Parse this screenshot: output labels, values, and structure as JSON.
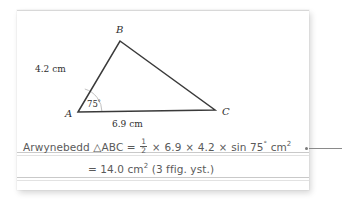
{
  "page": {
    "language": "Welsh",
    "background_color": "#ffffff",
    "card_color": "#ffffff",
    "ink_color": "#5a5a5a",
    "line_color": "#c9c9c9"
  },
  "diagram": {
    "name": "triangle-abc",
    "vertices": [
      {
        "label": "A",
        "x": 61,
        "y": 102
      },
      {
        "label": "B",
        "x": 103,
        "y": 31
      },
      {
        "label": "C",
        "x": 198,
        "y": 100
      }
    ],
    "side_labels": [
      {
        "id": "ab",
        "text": "4.2 cm",
        "x": 20,
        "y": 58
      },
      {
        "id": "ac",
        "text": "6.9 cm",
        "x": 96,
        "y": 112
      }
    ],
    "angle_label": {
      "text": "75",
      "degree": "°",
      "x": 72,
      "y": 92
    },
    "stroke_color": "#3a3a3a"
  },
  "working": {
    "line1": {
      "lead": "Arwynebedd",
      "triangle_symbol": "△",
      "triangle_name": "ABC",
      "equals": "=",
      "fraction_numerator": "1",
      "fraction_denominator": "2",
      "multiply": "×",
      "value_base": "6.9",
      "value_height": "4.2",
      "trig": "sin 75",
      "degree": "°",
      "units": "cm",
      "units_exponent": "2"
    },
    "line2": {
      "equals": "=",
      "result": "14.0",
      "units": "cm",
      "units_exponent": "2",
      "note": "(3 ffig. yst.)"
    }
  },
  "callout": {
    "dot_color": "#7a7a7a",
    "line_color": "#8a8a8a"
  }
}
